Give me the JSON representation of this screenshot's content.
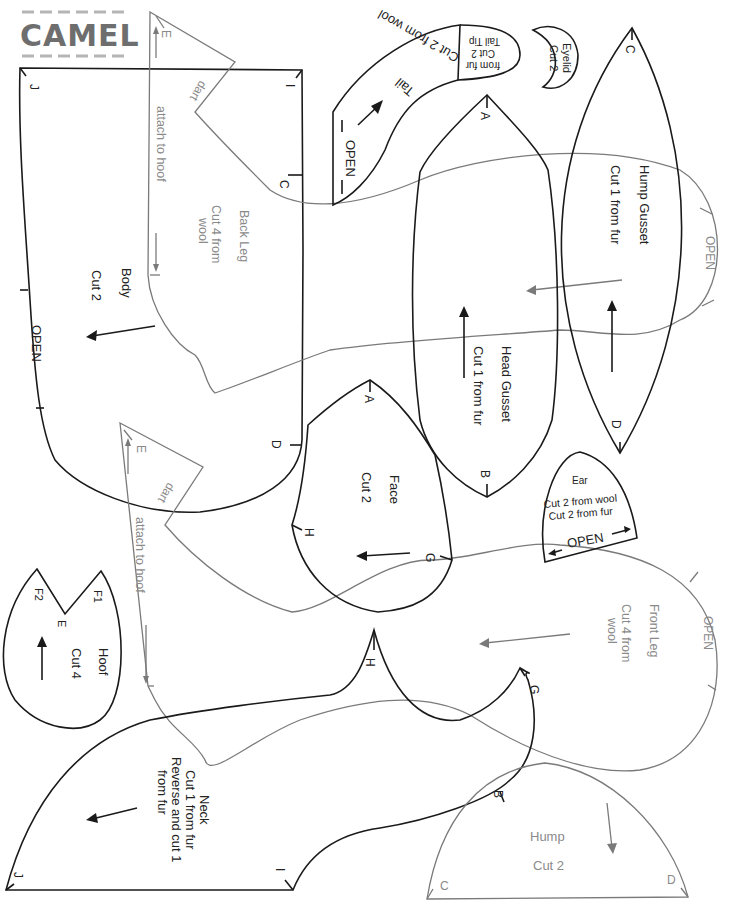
{
  "title": "CAMEL",
  "pieces": {
    "body": {
      "name": "Body",
      "cut": "Cut 2",
      "open": "OPEN",
      "marks": [
        "J",
        "I",
        "C",
        "D"
      ]
    },
    "back_leg": {
      "name": "Back Leg",
      "cut": "Cut 4 from",
      "cut2": "wool",
      "dart": "dart",
      "attach": "attach to hoof",
      "mark": "E"
    },
    "back_leg_lower": {
      "dart": "dart",
      "attach": "attach to hoof",
      "mark": "E"
    },
    "tail": {
      "name": "Tail",
      "cut": "Cut 2 from wool",
      "open": "OPEN"
    },
    "tail_tip": {
      "name": "Tail Tip",
      "cut": "Cut 2",
      "cut2": "from fur"
    },
    "eyelid": {
      "name": "Eyelid",
      "cut": "Cut 2"
    },
    "hump_gusset": {
      "name": "Hump Gusset",
      "cut": "Cut 1 from fur",
      "marks": [
        "C",
        "D"
      ]
    },
    "head_gusset": {
      "name": "Head Gusset",
      "cut": "Cut 1 from fur",
      "marks": [
        "A",
        "B"
      ]
    },
    "front_leg": {
      "name": "Front Leg",
      "cut": "Cut 4 from",
      "cut2": "wool",
      "open": "OPEN"
    },
    "face": {
      "name": "Face",
      "cut": "Cut 2",
      "marks": [
        "A",
        "H",
        "G"
      ]
    },
    "ear": {
      "name": "Ear",
      "cut": "Cut 2 from wool",
      "cut2": "Cut 2 from fur",
      "open": "OPEN"
    },
    "hoof": {
      "name": "Hoof",
      "cut": "Cut 4",
      "marks": [
        "F2",
        "F1",
        "E"
      ]
    },
    "neck": {
      "name": "Neck",
      "cut": "Cut 1 from fur",
      "cut2": "Reverse and cut 1",
      "cut3": "from fur",
      "marks": [
        "H",
        "G",
        "B",
        "I",
        "J"
      ]
    },
    "hump": {
      "name": "Hump",
      "cut": "Cut 2",
      "marks": [
        "C",
        "D"
      ]
    }
  },
  "colors": {
    "outline_black": "#1a1a1a",
    "outline_gray": "#7a7a7a",
    "title_gray": "#6e6e6e"
  }
}
